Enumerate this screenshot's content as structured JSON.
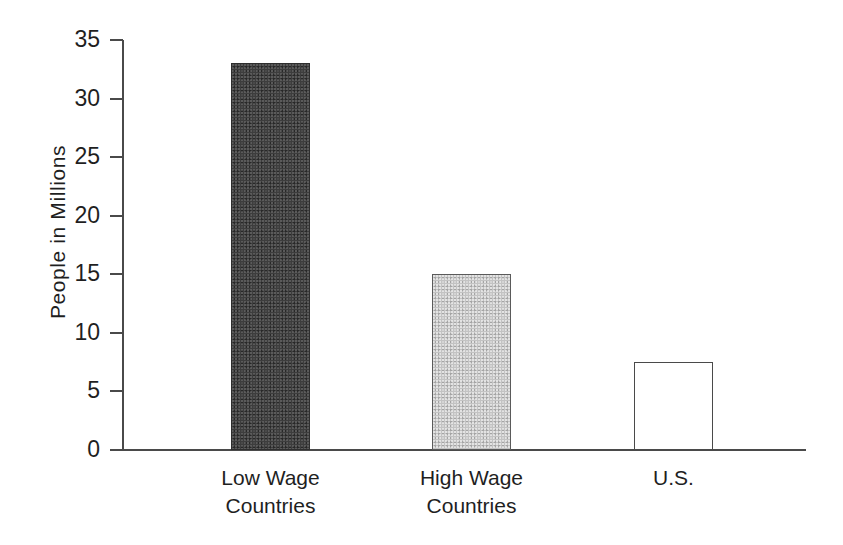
{
  "chart_data": {
    "type": "bar",
    "title": "",
    "subtitle": "",
    "xlabel": "",
    "ylabel": "People  in Millions",
    "categories": [
      "Low Wage Countries",
      "High Wage Countries",
      "U.S."
    ],
    "category_lines": [
      [
        "Low Wage",
        "Countries"
      ],
      [
        "High Wage",
        "Countries"
      ],
      [
        "U.S."
      ]
    ],
    "values": [
      33,
      15,
      7.5
    ],
    "ylim": [
      0,
      35
    ],
    "yticks": [
      0,
      5,
      10,
      15,
      20,
      25,
      30,
      35
    ],
    "ytick_labels": [
      "0",
      "5",
      "10",
      "15",
      "20",
      "25",
      "30",
      "35"
    ],
    "grid": false,
    "legend": false,
    "legend_position": "none",
    "bar_styles": [
      "dark",
      "light",
      "open"
    ],
    "colors": {
      "bar_dark": "#3d3d3d",
      "bar_light": "#c3c3c3",
      "bar_open": "#ffffff",
      "axis": "#4a4a4a",
      "text": "#1f1f1f",
      "background": "#ffffff"
    }
  }
}
